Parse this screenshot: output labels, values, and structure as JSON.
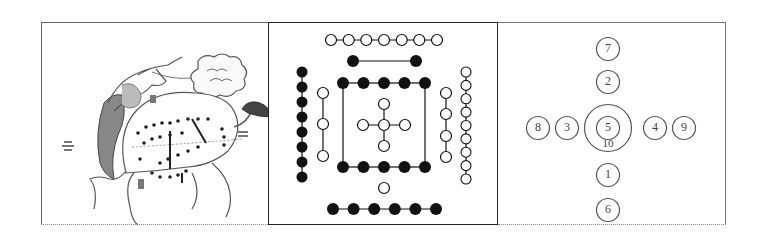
{
  "panels": [
    {
      "id": "dragon-horse",
      "description": "Ink illustration of a dragon-horse with dotted markings on its body",
      "labels": [
        "left glyph",
        "top glyph",
        "right glyph",
        "bottom glyph"
      ]
    },
    {
      "id": "he-tu-dots",
      "description": "He Tu diagram of black and white dots",
      "groups": [
        {
          "position": "top-outer",
          "color": "white",
          "count": 7,
          "orientation": "horizontal"
        },
        {
          "position": "top-inner",
          "color": "black",
          "count": 2,
          "orientation": "horizontal"
        },
        {
          "position": "left-outer",
          "color": "black",
          "count": 8,
          "orientation": "vertical"
        },
        {
          "position": "left-inner",
          "color": "white",
          "count": 3,
          "orientation": "vertical"
        },
        {
          "position": "square-top",
          "color": "black",
          "count": 5,
          "orientation": "horizontal"
        },
        {
          "position": "square-bottom",
          "color": "black",
          "count": 5,
          "orientation": "horizontal"
        },
        {
          "position": "center-cross",
          "color": "white",
          "count": 5,
          "orientation": "cross"
        },
        {
          "position": "right-inner",
          "color": "white",
          "count": 4,
          "orientation": "vertical"
        },
        {
          "position": "right-outer",
          "color": "white",
          "count": 9,
          "orientation": "vertical"
        },
        {
          "position": "bottom-inner",
          "color": "white",
          "count": 1,
          "orientation": "single"
        },
        {
          "position": "bottom-outer",
          "color": "black",
          "count": 6,
          "orientation": "horizontal"
        }
      ]
    },
    {
      "id": "numbered-circles",
      "description": "Numbered circle arrangement",
      "numbers": {
        "top_outer": "7",
        "top_inner": "2",
        "left_outer": "8",
        "left_inner": "3",
        "center": "5",
        "center_ring": "10",
        "right_inner": "4",
        "right_outer": "9",
        "bottom_inner": "1",
        "bottom_outer": "6"
      }
    }
  ]
}
